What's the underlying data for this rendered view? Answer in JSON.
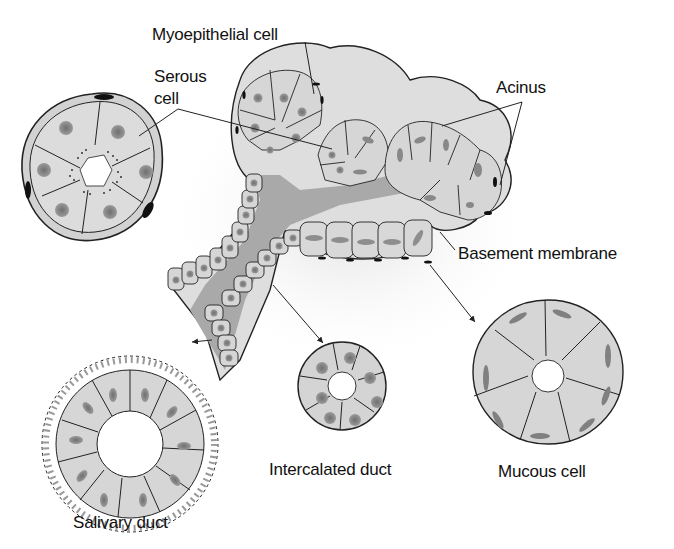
{
  "figure": {
    "labels": {
      "myoepithelial": "Myoepithelial cell",
      "serous_line1": "Serous",
      "serous_line2": "cell",
      "acinus": "Acinus",
      "basement": "Basement membrane",
      "intercalated": "Intercalated duct",
      "mucous": "Mucous cell",
      "salivary": "Salivary duct"
    },
    "colors": {
      "cell_fill": "#d4d4d4",
      "cell_light": "#e6e6e6",
      "nucleus": "#8c8c8c",
      "lumen": "#a8a8a8",
      "outline": "#222222",
      "myoepithelial_nucleus": "#111111",
      "background": "#ffffff"
    }
  }
}
